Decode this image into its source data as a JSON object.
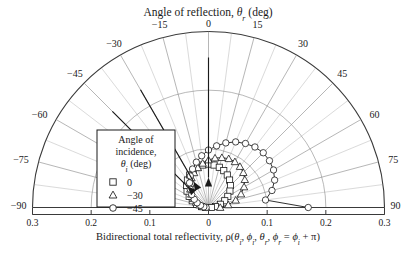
{
  "figure": {
    "top_title": "Angle of reflection, θr (deg)",
    "top_title_parts": {
      "main": "Angle of reflection, ",
      "sym": "θ",
      "sub": "r",
      "tail": " (deg)"
    },
    "x_axis_label_parts": {
      "lead": "Bidirectional total reflectivity, ρ(",
      "t1": "θ",
      "t1s": "i",
      "c1": ", ",
      "p1": "ϕ",
      "p1s": "i",
      "c2": ", ",
      "t2": "θ",
      "t2s": "r",
      "c3": ", ",
      "p2": "ϕ",
      "p2s": "r",
      "eq": " = ",
      "p3": "ϕ",
      "p3s": "i",
      "tail": " + π)"
    }
  },
  "legend": {
    "title_line1": "Angle of",
    "title_line2": "incidence,",
    "title_line3_sym": "θ",
    "title_line3_sub": "i",
    "title_line3_tail": " (deg)",
    "entries": [
      {
        "marker": "square-marker",
        "label": "0"
      },
      {
        "marker": "triangle-marker",
        "label": "−30"
      },
      {
        "marker": "circle-marker",
        "label": "−45"
      }
    ]
  },
  "chart_data": {
    "type": "line",
    "coordinate_system": "polar-half",
    "title": "Angle of reflection, θr (deg)",
    "xlabel": "Bidirectional total reflectivity, ρ(θi, ϕi, θr, ϕr = ϕi + π)",
    "ylabel": "",
    "grid": true,
    "legend_position": "left-inside",
    "angle_axis": {
      "label": "Angle of reflection, θr (deg)",
      "unit": "deg",
      "range": [
        -90,
        90
      ],
      "major_ticks": [
        -90,
        -75,
        -60,
        -45,
        -30,
        -15,
        0,
        15,
        30,
        45,
        60,
        75,
        90
      ],
      "tick_labels": [
        "−90",
        "−75",
        "−60",
        "−45",
        "−30",
        "−15",
        "0",
        "15",
        "30",
        "45",
        "60",
        "75",
        "90"
      ],
      "minor_tick_step": 7.5
    },
    "radial_axis": {
      "label": "Bidirectional total reflectivity",
      "range": [
        0,
        0.3
      ],
      "grid_rings": [
        0.1,
        0.2,
        0.3
      ],
      "left_tick_labels": [
        "0.3",
        "0.2",
        "0.1"
      ],
      "center_tick_label": "0",
      "right_tick_labels": [
        "0.1",
        "0.2",
        "0.3"
      ],
      "baseline_tick_labels": [
        "0.3",
        "0.2",
        "0.1",
        "0",
        "0.1",
        "0.2",
        "0.3"
      ]
    },
    "series": [
      {
        "name": "θi = 0",
        "marker": "square",
        "incidence_deg": 0,
        "theta_r": [
          -90,
          -82.5,
          -75,
          -67.5,
          -60,
          -52.5,
          -45,
          -37.5,
          -30,
          -22.5,
          -15,
          -7.5,
          0,
          7.5,
          15,
          22.5,
          30,
          37.5,
          45,
          52.5,
          60,
          67.5,
          75,
          82.5,
          90
        ],
        "rho": [
          0.005,
          0.012,
          0.021,
          0.03,
          0.038,
          0.046,
          0.053,
          0.059,
          0.064,
          0.068,
          0.071,
          0.073,
          0.074,
          0.073,
          0.071,
          0.068,
          0.064,
          0.059,
          0.053,
          0.046,
          0.038,
          0.03,
          0.021,
          0.012,
          0.005
        ]
      },
      {
        "name": "θi = −30",
        "marker": "triangle",
        "incidence_deg": -30,
        "theta_r": [
          -90,
          -82.5,
          -75,
          -67.5,
          -60,
          -52.5,
          -45,
          -37.5,
          -30,
          -22.5,
          -15,
          -7.5,
          0,
          7.5,
          15,
          22.5,
          30,
          37.5,
          45,
          52.5,
          60,
          67.5,
          75,
          82.5,
          90
        ],
        "rho": [
          0.004,
          0.009,
          0.016,
          0.023,
          0.03,
          0.037,
          0.044,
          0.051,
          0.058,
          0.064,
          0.07,
          0.076,
          0.081,
          0.085,
          0.088,
          0.09,
          0.09,
          0.088,
          0.084,
          0.078,
          0.07,
          0.06,
          0.048,
          0.034,
          0.02
        ]
      },
      {
        "name": "θi = −45",
        "marker": "circle",
        "incidence_deg": -45,
        "theta_r": [
          -90,
          -82.5,
          -75,
          -67.5,
          -60,
          -52.5,
          -45,
          -37.5,
          -30,
          -22.5,
          -15,
          -7.5,
          0,
          7.5,
          15,
          22.5,
          30,
          37.5,
          45,
          52.5,
          60,
          67.5,
          75,
          82.5,
          90
        ],
        "rho": [
          0.004,
          0.008,
          0.014,
          0.021,
          0.028,
          0.036,
          0.044,
          0.053,
          0.062,
          0.071,
          0.08,
          0.089,
          0.098,
          0.106,
          0.114,
          0.121,
          0.126,
          0.13,
          0.132,
          0.131,
          0.128,
          0.122,
          0.112,
          0.098,
          0.17
        ]
      }
    ],
    "incidence_arrows": [
      {
        "name": "arrow-incidence-0",
        "angle_deg": 0
      },
      {
        "name": "arrow-incidence-minus30",
        "angle_deg": -30
      },
      {
        "name": "arrow-incidence-minus45",
        "angle_deg": -45
      }
    ]
  },
  "colors": {
    "ink": "#1a1a1a",
    "grid": "#8a8a8a",
    "axis": "#3a3a3a",
    "marker_fill": "#ffffff",
    "background": "#ffffff"
  }
}
